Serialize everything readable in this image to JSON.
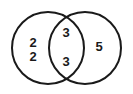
{
  "figure": {
    "type": "venn-diagram",
    "title": "",
    "width": 133,
    "height": 94,
    "background_color": "#ffffff",
    "stroke_color": "#1a1a1a",
    "stroke_width": 2,
    "text_color": "#1a1a1a"
  },
  "circles": {
    "left": {
      "name": "left-circle",
      "cx": 48,
      "cy": 48,
      "r": 36,
      "label": ""
    },
    "right": {
      "name": "right-circle",
      "cx": 85,
      "cy": 48,
      "r": 36,
      "label": ""
    }
  },
  "regions": {
    "left_only": {
      "name": "left-only-region",
      "values": [
        "2",
        "2"
      ]
    },
    "intersection": {
      "name": "intersection-region",
      "values": [
        "3",
        "3"
      ]
    },
    "right_only": {
      "name": "right-only-region",
      "values": [
        "5"
      ]
    }
  },
  "chart_data": {
    "type": "venn",
    "title": "",
    "sets": [
      "left-circle",
      "right-circle"
    ],
    "regions": [
      {
        "region": "left_only",
        "entries": [
          "2",
          "2"
        ],
        "count": 2
      },
      {
        "region": "intersection",
        "entries": [
          "3",
          "3"
        ],
        "count": 2
      },
      {
        "region": "right_only",
        "entries": [
          "5"
        ],
        "count": 1
      }
    ],
    "all_values": [
      "2",
      "2",
      "3",
      "3",
      "5"
    ],
    "legend": [],
    "xlabel": "",
    "ylabel": ""
  }
}
